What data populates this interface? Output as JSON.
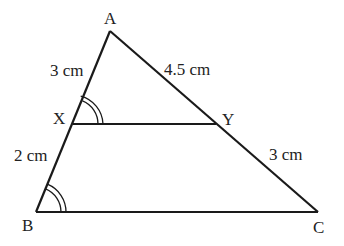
{
  "figure": {
    "type": "triangle-with-parallel-segment",
    "vertices": {
      "A": {
        "label": "A",
        "x": 110,
        "y": 31
      },
      "B": {
        "label": "B",
        "x": 36,
        "y": 212
      },
      "C": {
        "label": "C",
        "x": 318,
        "y": 212
      },
      "X": {
        "label": "X",
        "x": 73,
        "y": 124
      },
      "Y": {
        "label": "Y",
        "x": 216,
        "y": 124
      }
    },
    "measurements": {
      "AX": "3 cm",
      "AY": "4.5 cm",
      "XB": "2 cm",
      "YC": "3 cm"
    },
    "angle_marks": [
      {
        "at": "X",
        "between": [
          "XA",
          "XY"
        ],
        "style": "double-arc"
      },
      {
        "at": "B",
        "between": [
          "BA",
          "BC"
        ],
        "style": "double-arc"
      }
    ],
    "line_color": "#1a1a1a",
    "text_color": "#222222"
  }
}
